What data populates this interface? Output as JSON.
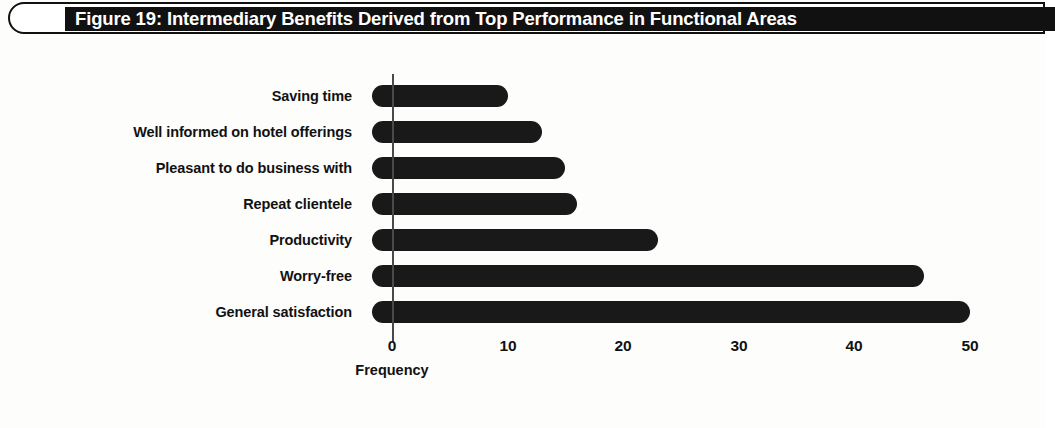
{
  "figure": {
    "title": "Figure 19: Intermediary Benefits Derived from Top Performance in Functional Areas",
    "bar_color": "#191919",
    "title_bar_color": "#111111",
    "title_text_color": "#ffffff",
    "background_color": "#fdfdfc"
  },
  "chart_data": {
    "type": "bar",
    "orientation": "horizontal",
    "title": "Figure 19: Intermediary Benefits Derived from Top Performance in Functional Areas",
    "subtitle": "",
    "xlabel": "Frequency",
    "ylabel": "",
    "categories": [
      "Saving time",
      "Well informed on hotel offerings",
      "Pleasant to do business with",
      "Repeat clientele",
      "Productivity",
      "Worry-free",
      "General satisfaction"
    ],
    "values": [
      10,
      13,
      15,
      16,
      23,
      46,
      50
    ],
    "xlim": [
      0,
      50
    ],
    "xticks": [
      0,
      10,
      20,
      30,
      40,
      50
    ],
    "xticklabels": [
      "0",
      "10",
      "20",
      "30",
      "40",
      "50"
    ],
    "grid": false,
    "legend": null,
    "legend_position": "none"
  }
}
